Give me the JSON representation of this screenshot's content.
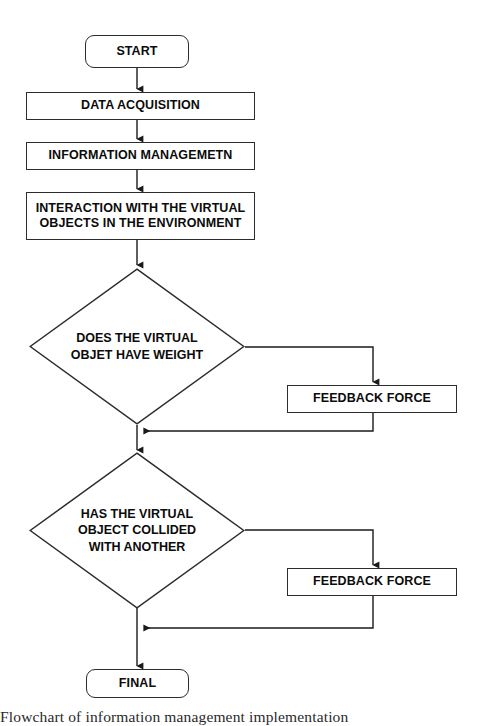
{
  "diagram": {
    "stroke_color": "#2c2c2c",
    "text_color": "#0b0b0b",
    "background_color": "#ffffff"
  },
  "nodes": {
    "start": {
      "label": "START",
      "shape": "terminator"
    },
    "data_acquisition": {
      "label": "DATA ACQUISITION",
      "shape": "process"
    },
    "information_management": {
      "label": "INFORMATION MANAGEMETN",
      "shape": "process"
    },
    "interaction": {
      "label": "INTERACTION WITH THE VIRTUAL\nOBJECTS IN THE ENVIRONMENT",
      "shape": "process"
    },
    "decision_weight": {
      "label": "DOES THE VIRTUAL\nOBJET HAVE WEIGHT",
      "shape": "decision"
    },
    "feedback_force_1": {
      "label": "FEEDBACK FORCE",
      "shape": "process"
    },
    "decision_collision": {
      "label": "HAS THE VIRTUAL\nOBJECT COLLIDED\nWITH ANOTHER",
      "shape": "decision"
    },
    "feedback_force_2": {
      "label": "FEEDBACK FORCE",
      "shape": "process"
    },
    "final": {
      "label": "FINAL",
      "shape": "terminator"
    }
  },
  "caption": {
    "text": "Flowchart of information management implementation"
  }
}
